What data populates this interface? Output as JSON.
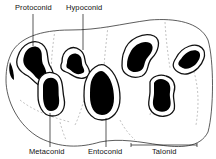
{
  "figure": {
    "labels": {
      "protoconid": "Protoconid",
      "hypoconid": "Hypoconid",
      "metaconid": "Metaconid",
      "entoconid": "Entoconid",
      "talonid": "Talonid"
    },
    "colors": {
      "ink": "#111111",
      "dashed": "#9a9a9a",
      "background": "#ffffff"
    }
  }
}
